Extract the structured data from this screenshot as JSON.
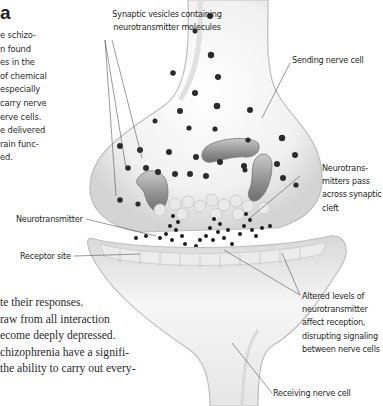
{
  "heading": "a",
  "side_text_lines": [
    "e schizo-",
    "n found",
    "es in the",
    "of chemical",
    "especially",
    "carry nerve",
    "erve cells.",
    "e delivered",
    "rain func-",
    "ed."
  ],
  "body_text_lines": [
    "te their responses.",
    "raw from all interaction",
    "ecome deeply depressed.",
    "chizophrenia have a signifi-",
    "the ability to carry out every-"
  ],
  "diagram": {
    "labels": {
      "synaptic_vesicles": [
        "Synaptic vesicles containing",
        "neurotransmitter molecules"
      ],
      "sending_cell": [
        "Sending nerve cell"
      ],
      "neurotransmitters_pass": [
        "Neurotrans-",
        "mitters pass",
        "across synaptic",
        "cleft"
      ],
      "neurotransmitter": [
        "Neurotransmitter"
      ],
      "receptor_site": [
        "Receptor site"
      ],
      "altered_levels": [
        "Altered levels of",
        "neurotransmitter",
        "affect reception,",
        "disrupting signaling",
        "between nerve cells"
      ],
      "receiving_cell": [
        "Receiving nerve cell"
      ]
    },
    "colors": {
      "ink": "#231f20",
      "cell_fill": "#f4f4f4",
      "cell_shadow": "#c8c8c8",
      "vesicle": "#2b2b2b",
      "mitochondria": "#9a9a9a",
      "leader_line": "#555555"
    }
  }
}
